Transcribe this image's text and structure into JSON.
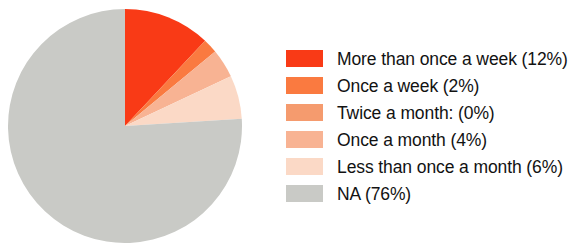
{
  "chart_data": {
    "type": "pie",
    "title": "",
    "subtitle": "",
    "xlabel": "",
    "ylabel": "",
    "grid": false,
    "legend_position": "right",
    "start_angle_deg": 0,
    "direction": "clockwise",
    "unit": "%",
    "categories": [
      "More than once a week",
      "Once a week",
      "Twice a month:",
      "Once a month",
      "Less than once a month",
      "NA"
    ],
    "values": [
      12,
      2,
      0,
      4,
      6,
      76
    ],
    "colors": [
      "#f93a16",
      "#fa7a40",
      "#f59b6e",
      "#f8b393",
      "#fbd9c6",
      "#c9cac6"
    ],
    "slices": [
      {
        "label": "More than once a week",
        "value": 12,
        "value_text": "(12%)",
        "color": "#f93a16"
      },
      {
        "label": "Once a week",
        "value": 2,
        "value_text": "(2%)",
        "color": "#fa7a40"
      },
      {
        "label": "Twice a month:",
        "value": 0,
        "value_text": "(0%)",
        "color": "#f59b6e"
      },
      {
        "label": "Once a month",
        "value": 4,
        "value_text": "(4%)",
        "color": "#f8b393"
      },
      {
        "label": "Less than once a month",
        "value": 6,
        "value_text": "(6%)",
        "color": "#fbd9c6"
      },
      {
        "label": "NA",
        "value": 76,
        "value_text": "(76%)",
        "color": "#c9cac6"
      }
    ]
  },
  "legend": {
    "items": [
      {
        "text": "More than once a week (12%)",
        "color": "#f93a16"
      },
      {
        "text": "Once a week (2%)",
        "color": "#fa7a40"
      },
      {
        "text": "Twice a month: (0%)",
        "color": "#f59b6e"
      },
      {
        "text": "Once a month (4%)",
        "color": "#f8b393"
      },
      {
        "text": "Less than once a month (6%)",
        "color": "#fbd9c6"
      },
      {
        "text": "NA (76%)",
        "color": "#c9cac6"
      }
    ]
  },
  "background_color": "#ffffff",
  "text_color": "#121212"
}
